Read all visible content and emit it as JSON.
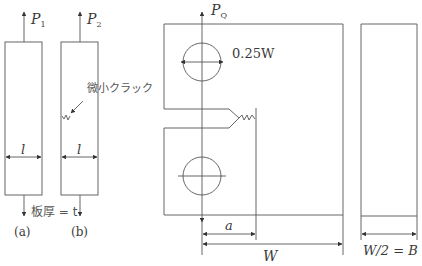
{
  "figure": {
    "panel_a": {
      "load_label": "P",
      "load_sub": "1",
      "width_label": "l",
      "caption": "(a)"
    },
    "panel_b": {
      "load_label": "P",
      "load_sub": "2",
      "width_label": "l",
      "caption": "(b)",
      "crack_label": "微小クラック"
    },
    "thickness_label": "板厚 = t",
    "ct_specimen": {
      "load_label": "P",
      "load_sub": "Q",
      "hole_dim_label": "0.25W",
      "crack_length_label": "a",
      "width_label": "W"
    },
    "side_view": {
      "thickness_label": "W/2 = B"
    }
  },
  "colors": {
    "line": "#555555",
    "text": "#3a3a3a"
  }
}
